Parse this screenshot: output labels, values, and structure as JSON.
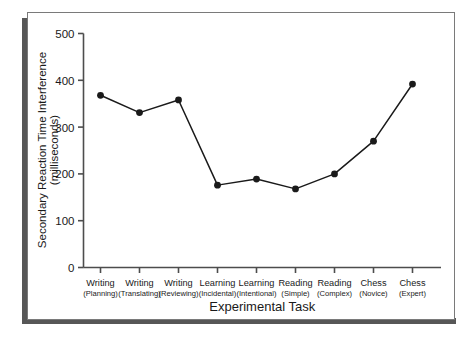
{
  "chart_data": {
    "type": "line",
    "title": "",
    "xlabel": "Experimental Task",
    "ylabel_line1": "Secondary Reaction Time Interference",
    "ylabel_line2": "(milliseconds)",
    "categories": [
      "Writing\n(Planning)",
      "Writing\n(Translating)",
      "Writing\n(Reviewing)",
      "Learning\n(Incidental)",
      "Learning\n(Intentional)",
      "Reading\n(Simple)",
      "Reading\n(Complex)",
      "Chess\n(Novice)",
      "Chess\n(Expert)"
    ],
    "category_labels": [
      {
        "main": "Writing",
        "sub": "(Planning)"
      },
      {
        "main": "Writing",
        "sub": "(Translating)"
      },
      {
        "main": "Writing",
        "sub": "(Reviewing)"
      },
      {
        "main": "Learning",
        "sub": "(Incidental)"
      },
      {
        "main": "Learning",
        "sub": "(Intentional)"
      },
      {
        "main": "Reading",
        "sub": "(Simple)"
      },
      {
        "main": "Reading",
        "sub": "(Complex)"
      },
      {
        "main": "Chess",
        "sub": "(Novice)"
      },
      {
        "main": "Chess",
        "sub": "(Expert)"
      }
    ],
    "values": [
      368,
      331,
      358,
      176,
      189,
      168,
      200,
      270,
      392
    ],
    "ylim": [
      0,
      500
    ],
    "yticks": [
      0,
      100,
      200,
      300,
      400,
      500
    ],
    "ytick_labels": [
      "0",
      "100",
      "200",
      "300",
      "400",
      "500"
    ],
    "grid": false,
    "legend": null,
    "marker": "filled-circle",
    "line_color": "#1a1a1a",
    "marker_color": "#1a1a1a",
    "axis_color": "#4d4d4d",
    "background_color": "#ffffff",
    "frame_color": "#7a7a7a",
    "shadow_color": "#575757"
  }
}
